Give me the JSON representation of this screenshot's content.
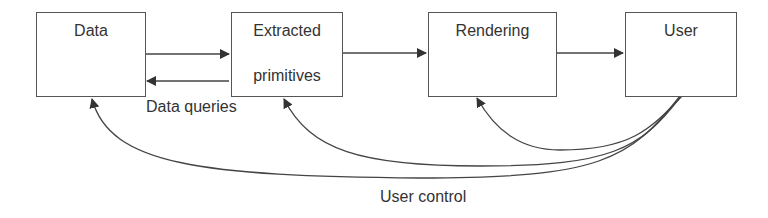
{
  "nodes": {
    "data": {
      "label": "Data"
    },
    "extracted": {
      "line1": "Extracted",
      "line2": "primitives"
    },
    "rendering": {
      "label": "Rendering"
    },
    "user": {
      "label": "User"
    }
  },
  "edge_labels": {
    "data_queries": "Data queries",
    "user_control": "User control"
  },
  "colors": {
    "stroke": "#444444",
    "text": "#333333",
    "background": "#ffffff"
  }
}
